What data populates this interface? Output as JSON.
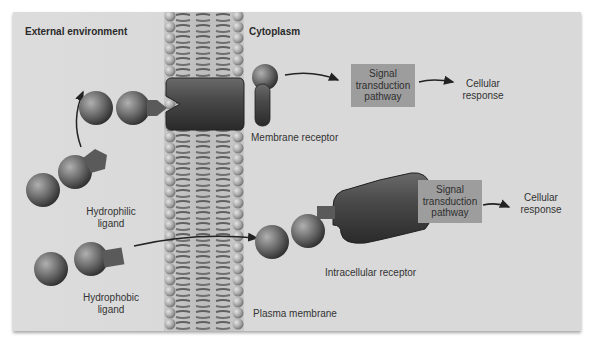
{
  "diagram": {
    "title_regions": {
      "external": "External environment",
      "cytoplasm": "Cytoplasm"
    },
    "labels": {
      "membrane_receptor": "Membrane receptor",
      "intracellular_receptor": "Intracellular receptor",
      "plasma_membrane": "Plasma membrane",
      "hydrophilic_ligand_1": "Hydrophilic",
      "hydrophilic_ligand_2": "ligand",
      "hydrophobic_ligand_1": "Hydrophobic",
      "hydrophobic_ligand_2": "ligand"
    },
    "top_pathway": {
      "box_line1": "Signal",
      "box_line2": "transduction",
      "box_line3": "pathway",
      "response_line1": "Cellular",
      "response_line2": "response"
    },
    "bottom_pathway": {
      "box_line1": "Signal",
      "box_line2": "transduction",
      "box_line3": "pathway",
      "response_line1": "Cellular",
      "response_line2": "response"
    },
    "colors": {
      "receptor": "#3a3a3a",
      "ligand": "#5e5e5e",
      "box": "#9d9d9d",
      "background": "#d8d8d8"
    }
  }
}
